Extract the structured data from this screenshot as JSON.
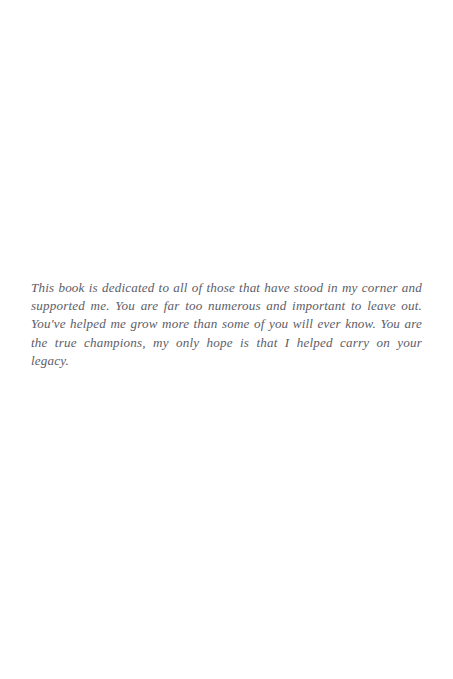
{
  "page": {
    "type": "book-dedication-page",
    "background_color": "#ffffff",
    "width": 453,
    "height": 679
  },
  "dedication": {
    "text": "This book is dedicated to all of those that have stood in my corner and supported me. You are far too numerous and important to leave out. You've helped me grow more than some of you will ever know. You are the true champions, my only hope is that I helped carry on your legacy.",
    "text_color": "#50505a",
    "alignment": "justified",
    "style": "italic-serif",
    "lines": [
      "This book is dedicated to all of those that have stood in my corner and",
      "supported me. You are far too numerous and important to leave out. You've",
      "helped me grow more than some of you will ever know. You are the true",
      "champions, my only hope is that I helped carry on your legacy."
    ]
  }
}
